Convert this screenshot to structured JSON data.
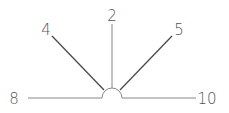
{
  "diagram": {
    "type": "angle-ray-fan",
    "hub": {
      "shape": "semicircle",
      "cx": 112,
      "cy": 98,
      "r": 10
    },
    "rays": [
      {
        "id": "ray-8",
        "label": "8",
        "direction": "left-horizontal",
        "label_x": 14,
        "label_y": 104,
        "x1": 28,
        "y1": 98,
        "x2": 102,
        "y2": 98
      },
      {
        "id": "ray-4",
        "label": "4",
        "direction": "upper-left-diagonal",
        "label_x": 46,
        "label_y": 35,
        "x1": 52,
        "y1": 36,
        "x2": 104,
        "y2": 90
      },
      {
        "id": "ray-2",
        "label": "2",
        "direction": "vertical",
        "label_x": 112,
        "label_y": 21,
        "x1": 112,
        "y1": 24,
        "x2": 112,
        "y2": 88
      },
      {
        "id": "ray-5",
        "label": "5",
        "direction": "upper-right-diagonal",
        "label_x": 179,
        "label_y": 35,
        "x1": 172,
        "y1": 36,
        "x2": 120,
        "y2": 90
      },
      {
        "id": "ray-10",
        "label": "10",
        "direction": "right-horizontal",
        "label_x": 207,
        "label_y": 104,
        "x1": 122,
        "y1": 98,
        "x2": 196,
        "y2": 98
      }
    ]
  },
  "colors": {
    "line": "#4a4a4a",
    "label": "#555555",
    "background": "#ffffff"
  }
}
